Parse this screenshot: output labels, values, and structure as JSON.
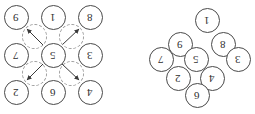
{
  "figure": {
    "background_color": "#ffffff",
    "circle_stroke_color": "#4a4a4a",
    "ghost_stroke_color": "#9a9a9a",
    "digit_color": "#2e2e2e",
    "digit_rotation_degrees": 180
  },
  "left_diagram": {
    "name": "square-grid-diagram",
    "layout": "3x3 grid",
    "nodes": [
      {
        "id": "l-9",
        "label": "9",
        "row": 0,
        "col": 0,
        "x": 16,
        "y": 17
      },
      {
        "id": "l-1",
        "label": "1",
        "row": 0,
        "col": 1,
        "x": 53,
        "y": 17
      },
      {
        "id": "l-8",
        "label": "8",
        "row": 0,
        "col": 2,
        "x": 90,
        "y": 17
      },
      {
        "id": "l-7",
        "label": "7",
        "row": 1,
        "col": 0,
        "x": 16,
        "y": 55
      },
      {
        "id": "l-5",
        "label": "5",
        "row": 1,
        "col": 1,
        "x": 53,
        "y": 55
      },
      {
        "id": "l-3",
        "label": "3",
        "row": 1,
        "col": 2,
        "x": 90,
        "y": 55
      },
      {
        "id": "l-2",
        "label": "2",
        "row": 2,
        "col": 0,
        "x": 16,
        "y": 92
      },
      {
        "id": "l-6",
        "label": "6",
        "row": 2,
        "col": 1,
        "x": 53,
        "y": 92
      },
      {
        "id": "l-4",
        "label": "4",
        "row": 2,
        "col": 2,
        "x": 90,
        "y": 92
      }
    ],
    "ghost_circles": [
      {
        "id": "g-tl",
        "x": 34,
        "y": 36
      },
      {
        "id": "g-tr",
        "x": 71,
        "y": 36
      },
      {
        "id": "g-bl",
        "x": 34,
        "y": 73
      },
      {
        "id": "g-br",
        "x": 71,
        "y": 73
      }
    ],
    "rotation_arrows": [
      {
        "id": "a-tl",
        "from_x": 41,
        "from_y": 43,
        "to_x": 25,
        "to_y": 27,
        "direction": "up-left"
      },
      {
        "id": "a-tr",
        "from_x": 64,
        "from_y": 43,
        "to_x": 81,
        "to_y": 27,
        "direction": "up-right"
      },
      {
        "id": "a-bl",
        "from_x": 41,
        "from_y": 66,
        "to_x": 25,
        "to_y": 82,
        "direction": "down-left"
      },
      {
        "id": "a-br",
        "from_x": 64,
        "from_y": 66,
        "to_x": 81,
        "to_y": 82,
        "direction": "down-right"
      }
    ]
  },
  "right_diagram": {
    "name": "diamond-grid-diagram",
    "layout": "3x3 grid rotated 45 degrees",
    "nodes": [
      {
        "id": "r-1",
        "label": "1",
        "x": 207,
        "y": 20
      },
      {
        "id": "r-9",
        "label": "9",
        "x": 180,
        "y": 44
      },
      {
        "id": "r-8",
        "label": "8",
        "x": 223,
        "y": 44
      },
      {
        "id": "r-7",
        "label": "7",
        "x": 161,
        "y": 59
      },
      {
        "id": "r-5",
        "label": "5",
        "x": 196,
        "y": 59
      },
      {
        "id": "r-3",
        "label": "3",
        "x": 238,
        "y": 59
      },
      {
        "id": "r-2",
        "label": "2",
        "x": 178,
        "y": 78
      },
      {
        "id": "r-4",
        "label": "4",
        "x": 212,
        "y": 78
      },
      {
        "id": "r-6",
        "label": "6",
        "x": 197,
        "y": 95
      }
    ]
  }
}
